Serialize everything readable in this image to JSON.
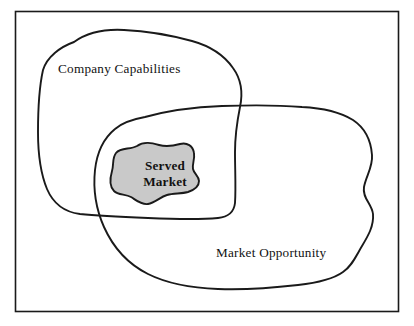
{
  "figure": {
    "background_color": "#ffffff",
    "frame": {
      "name": "outer-frame",
      "stroke_color": "#1a1a1a"
    }
  },
  "regions": {
    "company_capabilities": {
      "label": "Company Capabilities",
      "fill": "none",
      "stroke_color": "#1a1a1a"
    },
    "market_opportunity": {
      "label": "Market Opportunity",
      "fill": "none",
      "stroke_color": "#1a1a1a"
    },
    "served_market": {
      "label_line_1": "Served",
      "label_line_2": "Market",
      "fill": "#c9c9c9",
      "stroke_color": "#1a1a1a"
    }
  }
}
